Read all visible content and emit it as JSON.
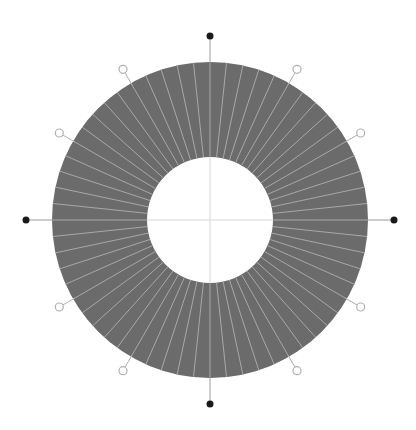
{
  "diagram": {
    "type": "radial-ring-dial",
    "center": [
      210,
      220
    ],
    "outer_radius": 158,
    "inner_radius": 63,
    "segments": 60,
    "ring_color": "#6b6b6b",
    "divider_color": "#a8a8a8",
    "crosshair_color": "#d6d6d6",
    "major_markers": {
      "count": 4,
      "angles_deg": [
        0,
        90,
        180,
        270
      ],
      "radius": 184,
      "style": "filled-dot",
      "color": "#1a1a1a"
    },
    "minor_markers": {
      "count": 8,
      "angles_deg": [
        30,
        60,
        120,
        150,
        210,
        240,
        300,
        330
      ],
      "radius": 174,
      "style": "hollow-circle",
      "color": "#b0b0b0"
    }
  }
}
